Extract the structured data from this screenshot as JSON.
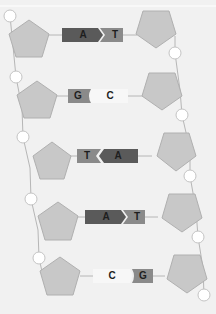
{
  "diagram": {
    "colors": {
      "background": "#f1f1f1",
      "sugar": "#c8c8c8",
      "sugar_stroke": "#b0b0b0",
      "phosphate": "#ffffff",
      "phosphate_stroke": "#c4c4c4",
      "backbone": "#b6b6b6",
      "adenine": "#5a5a5a",
      "thymine": "#8a8a8a",
      "guanine": "#8a8a8a",
      "cytosine": "#f7f7f7"
    },
    "base_pairs": [
      {
        "left": "A",
        "right": "T",
        "left_type": "adenine",
        "right_type": "thymine"
      },
      {
        "left": "G",
        "right": "C",
        "left_type": "guanine",
        "right_type": "cytosine"
      },
      {
        "left": "T",
        "right": "A",
        "left_type": "thymine",
        "right_type": "adenine"
      },
      {
        "left": "A",
        "right": "T",
        "left_type": "adenine",
        "right_type": "thymine"
      },
      {
        "left": "C",
        "right": "G",
        "left_type": "cytosine",
        "right_type": "guanine"
      }
    ],
    "left_strand": {
      "sugar_count": 5,
      "phosphate_count": 5
    },
    "right_strand": {
      "sugar_count": 5,
      "phosphate_count": 5
    }
  }
}
